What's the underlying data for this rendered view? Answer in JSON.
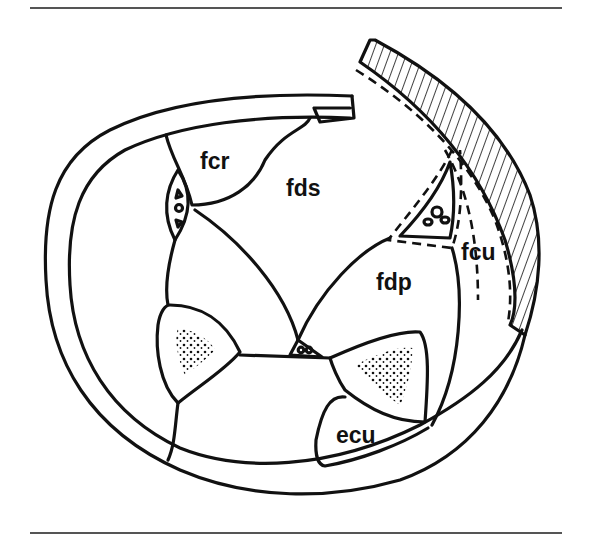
{
  "diagram": {
    "type": "anatomical-cross-section",
    "labels": {
      "fcr": "fcr",
      "fds": "fds",
      "fdp": "fdp",
      "fcu": "fcu",
      "ecu": "ecu"
    },
    "colors": {
      "line": "#111111",
      "background": "#ffffff",
      "rule": "#555555"
    }
  }
}
